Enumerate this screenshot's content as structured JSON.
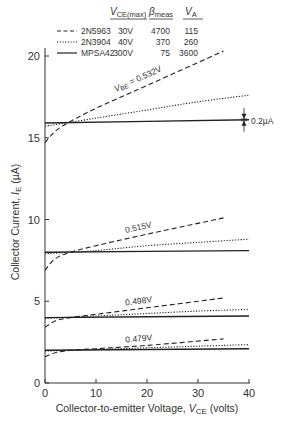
{
  "chart_data": {
    "type": "line",
    "title": "",
    "xlabel": "Collector-to-emitter Voltage, V_CE (volts)",
    "ylabel": "Collector Current, I_E (µA)",
    "xlim": [
      0,
      40
    ],
    "ylim": [
      0,
      22
    ],
    "xticks": [
      0,
      10,
      20,
      30,
      40
    ],
    "yticks": [
      0,
      5,
      10,
      15,
      20
    ],
    "grid": false,
    "legend_position": "top",
    "legend_table": {
      "headers": [
        "",
        "V_CE(max)",
        "β_meas",
        "V_A"
      ],
      "rows": [
        {
          "name": "2N5963",
          "style": "dashed",
          "vce_max": "30V",
          "beta": "4700",
          "va": "115"
        },
        {
          "name": "2N3904",
          "style": "dotted",
          "vce_max": "40V",
          "beta": "370",
          "va": "260"
        },
        {
          "name": "MPSA42",
          "style": "solid",
          "vce_max": "300V",
          "beta": "75",
          "va": "3600"
        }
      ]
    },
    "groups": [
      {
        "vbe_label": "V_BE = 0.532V",
        "series": [
          {
            "name": "2N5963",
            "x": [
              0,
              2,
              5,
              10,
              20,
              35
            ],
            "y": [
              14.7,
              15.4,
              16.0,
              16.8,
              18.2,
              20.3
            ]
          },
          {
            "name": "2N3904",
            "x": [
              0,
              10,
              20,
              30,
              40
            ],
            "y": [
              15.7,
              16.2,
              16.7,
              17.2,
              17.6
            ]
          },
          {
            "name": "MPSA42",
            "x": [
              0,
              40
            ],
            "y": [
              15.9,
              16.1
            ]
          }
        ]
      },
      {
        "vbe_label": "0.515V",
        "series": [
          {
            "name": "2N5963",
            "x": [
              0,
              2,
              5,
              10,
              20,
              35
            ],
            "y": [
              6.9,
              7.6,
              8.0,
              8.4,
              9.1,
              10.1
            ]
          },
          {
            "name": "2N3904",
            "x": [
              0,
              10,
              20,
              30,
              40
            ],
            "y": [
              7.9,
              8.1,
              8.4,
              8.6,
              8.8
            ]
          },
          {
            "name": "MPSA42",
            "x": [
              0,
              40
            ],
            "y": [
              8.0,
              8.1
            ]
          }
        ]
      },
      {
        "vbe_label": "0.498V",
        "series": [
          {
            "name": "2N5963",
            "x": [
              0,
              2,
              5,
              10,
              20,
              35
            ],
            "y": [
              3.4,
              3.8,
              4.0,
              4.2,
              4.6,
              5.2
            ]
          },
          {
            "name": "2N3904",
            "x": [
              0,
              10,
              20,
              30,
              40
            ],
            "y": [
              3.95,
              4.1,
              4.25,
              4.4,
              4.5
            ]
          },
          {
            "name": "MPSA42",
            "x": [
              0,
              40
            ],
            "y": [
              4.0,
              4.1
            ]
          }
        ]
      },
      {
        "vbe_label": "0.479V",
        "series": [
          {
            "name": "2N5963",
            "x": [
              0,
              2,
              5,
              10,
              20,
              35
            ],
            "y": [
              1.6,
              1.85,
              2.0,
              2.1,
              2.3,
              2.7
            ]
          },
          {
            "name": "2N3904",
            "x": [
              0,
              10,
              20,
              30,
              40
            ],
            "y": [
              1.95,
              2.05,
              2.15,
              2.25,
              2.35
            ]
          },
          {
            "name": "MPSA42",
            "x": [
              0,
              40
            ],
            "y": [
              2.0,
              2.1
            ]
          }
        ]
      }
    ],
    "annotations": [
      {
        "text": "0.2µA",
        "x": 40,
        "y": 16.1,
        "type": "dimension-arrows"
      }
    ]
  },
  "legend": {
    "header_vce": "V",
    "header_vce_sub": "CE(max)",
    "header_beta": "β",
    "header_beta_sub": "meas",
    "header_va": "V",
    "header_va_sub": "A"
  },
  "axes": {
    "x_title_pre": "Collector-to-emitter Voltage, ",
    "x_title_var": "V",
    "x_title_sub": "CE",
    "x_title_post": " (volts)",
    "y_title_pre": "Collector Current, ",
    "y_title_var": "I",
    "y_title_sub": "E",
    "y_title_post": " (µA)"
  },
  "annotation_text": "0.2µA"
}
